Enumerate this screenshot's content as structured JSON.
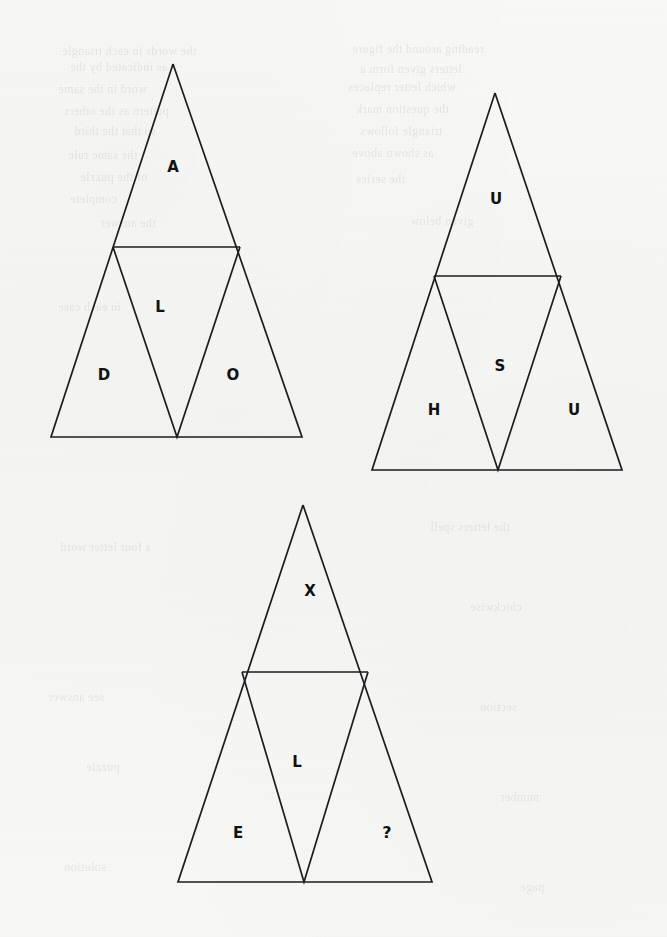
{
  "page": {
    "background_color": "#f7f7f6",
    "ink_color": "#1d1d1d",
    "label_color": "#121212",
    "width": 667,
    "height": 937
  },
  "ghost_marks": [
    {
      "text": "the words in each triangle",
      "x": 62,
      "y": 44
    },
    {
      "text": "reading around the figure",
      "x": 352,
      "y": 42
    },
    {
      "text": "as indicated by the",
      "x": 70,
      "y": 60
    },
    {
      "text": "letters given form a",
      "x": 360,
      "y": 62
    },
    {
      "text": "word in the same",
      "x": 58,
      "y": 82
    },
    {
      "text": "which letter replaces",
      "x": 348,
      "y": 80
    },
    {
      "text": "pattern as the others",
      "x": 64,
      "y": 104
    },
    {
      "text": "the question mark",
      "x": 356,
      "y": 102
    },
    {
      "text": "so that the third",
      "x": 74,
      "y": 124
    },
    {
      "text": "triangle follows",
      "x": 360,
      "y": 124
    },
    {
      "text": "the same rule",
      "x": 68,
      "y": 148
    },
    {
      "text": "as shown above",
      "x": 352,
      "y": 146
    },
    {
      "text": "of the puzzle",
      "x": 80,
      "y": 170
    },
    {
      "text": "the series",
      "x": 356,
      "y": 172
    },
    {
      "text": "complete",
      "x": 70,
      "y": 192
    },
    {
      "text": "the answer",
      "x": 100,
      "y": 216
    },
    {
      "text": "given below",
      "x": 410,
      "y": 214
    },
    {
      "text": "in each case",
      "x": 58,
      "y": 300
    },
    {
      "text": "the letters spell",
      "x": 430,
      "y": 520
    },
    {
      "text": "a four letter word",
      "x": 60,
      "y": 540
    },
    {
      "text": "clockwise",
      "x": 470,
      "y": 600
    },
    {
      "text": "see answer",
      "x": 48,
      "y": 690
    },
    {
      "text": "section",
      "x": 480,
      "y": 700
    },
    {
      "text": "puzzle",
      "x": 86,
      "y": 760
    },
    {
      "text": "number",
      "x": 500,
      "y": 790
    },
    {
      "text": "solution",
      "x": 64,
      "y": 860
    },
    {
      "text": "page",
      "x": 520,
      "y": 880
    }
  ],
  "figures": [
    {
      "id": "figure-1",
      "name": "triangle-figure-1",
      "geometry": {
        "apex": {
          "x": 173,
          "y": 64
        },
        "base_left": {
          "x": 51,
          "y": 437
        },
        "base_right": {
          "x": 302,
          "y": 437
        },
        "divider_left": {
          "x": 113,
          "y": 247
        },
        "divider_right": {
          "x": 240,
          "y": 247
        },
        "inner_bottom": {
          "x": 177,
          "y": 437
        }
      },
      "cells": [
        {
          "position": "top",
          "label": "A",
          "x": 173,
          "y": 167
        },
        {
          "position": "center",
          "label": "L",
          "x": 160,
          "y": 307
        },
        {
          "position": "left",
          "label": "D",
          "x": 104,
          "y": 375
        },
        {
          "position": "right",
          "label": "O",
          "x": 233,
          "y": 375
        }
      ]
    },
    {
      "id": "figure-2",
      "name": "triangle-figure-2",
      "geometry": {
        "apex": {
          "x": 495,
          "y": 93
        },
        "base_left": {
          "x": 372,
          "y": 470
        },
        "base_right": {
          "x": 622,
          "y": 470
        },
        "divider_left": {
          "x": 434,
          "y": 276
        },
        "divider_right": {
          "x": 561,
          "y": 276
        },
        "inner_bottom": {
          "x": 498,
          "y": 470
        }
      },
      "cells": [
        {
          "position": "top",
          "label": "U",
          "x": 496,
          "y": 199
        },
        {
          "position": "center",
          "label": "S",
          "x": 500,
          "y": 366
        },
        {
          "position": "left",
          "label": "H",
          "x": 434,
          "y": 410
        },
        {
          "position": "right",
          "label": "U",
          "x": 574,
          "y": 410
        }
      ]
    },
    {
      "id": "figure-3",
      "name": "triangle-figure-3",
      "geometry": {
        "apex": {
          "x": 303,
          "y": 505
        },
        "base_left": {
          "x": 178,
          "y": 882
        },
        "base_right": {
          "x": 432,
          "y": 882
        },
        "divider_left": {
          "x": 242,
          "y": 672
        },
        "divider_right": {
          "x": 368,
          "y": 672
        },
        "inner_bottom": {
          "x": 304,
          "y": 882
        }
      },
      "cells": [
        {
          "position": "top",
          "label": "X",
          "x": 310,
          "y": 591
        },
        {
          "position": "center",
          "label": "L",
          "x": 297,
          "y": 762
        },
        {
          "position": "left",
          "label": "E",
          "x": 238,
          "y": 833
        },
        {
          "position": "right",
          "label": "?",
          "x": 387,
          "y": 833
        }
      ]
    }
  ]
}
